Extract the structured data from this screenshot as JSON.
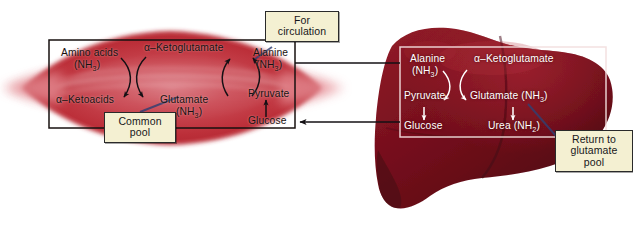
{
  "diagram": {
    "colors": {
      "muscle_fill": "#c0333c",
      "muscle_core": "#d4606a",
      "liver_fill": "#7c1220",
      "liver_dark": "#4d0a14",
      "callout_bg": "#f4f0d2",
      "callout_border": "#2a2a2a",
      "pointer_blue": "#2f3f73",
      "muscle_box_border": "#17110f",
      "liver_box_border": "#f2dede"
    }
  },
  "muscle": {
    "name": "muscle",
    "box_name": "muscle-reaction-box",
    "labels": {
      "amino_acids": "Amino acids",
      "amino_acids_sub": "(NH",
      "amino_acids_sub_num": "3",
      "amino_acids_sub_end": ")",
      "ketoglutamate": "α–Ketoglutamate",
      "ketoacids": "α–Ketoacids",
      "glutamate": "Glutamate",
      "glutamate_sub": "(NH",
      "glutamate_sub_num": "3",
      "glutamate_sub_end": ")",
      "alanine": "Alanine",
      "alanine_sub": "(NH",
      "alanine_sub_num": "3",
      "alanine_sub_end": ")",
      "pyruvate": "Pyruvate",
      "glucose": "Glucose"
    }
  },
  "liver": {
    "name": "liver",
    "box_name": "liver-reaction-box",
    "labels": {
      "alanine": "Alanine",
      "alanine_sub": "(NH",
      "alanine_sub_num": "3",
      "alanine_sub_end": ")",
      "ketoglutamate": "α–Ketoglutamate",
      "pyruvate": "Pyruvate",
      "glutamate": "Glutamate (NH",
      "glutamate_sub_num": "3",
      "glutamate_sub_end": ")",
      "glucose": "Glucose",
      "urea": "Urea (NH",
      "urea_sub_num": "2",
      "urea_sub_end": ")"
    }
  },
  "callouts": [
    {
      "id": "for-circulation",
      "line1": "For",
      "line2": "circulation",
      "line3": ""
    },
    {
      "id": "common-pool",
      "line1": "Common",
      "line2": "pool",
      "line3": ""
    },
    {
      "id": "return-to-pool",
      "line1": "Return to",
      "line2": "glutamate",
      "line3": "pool"
    }
  ],
  "connectors": {
    "top": "alanine transported from muscle to liver",
    "bottom": "glucose returned from liver to muscle"
  }
}
